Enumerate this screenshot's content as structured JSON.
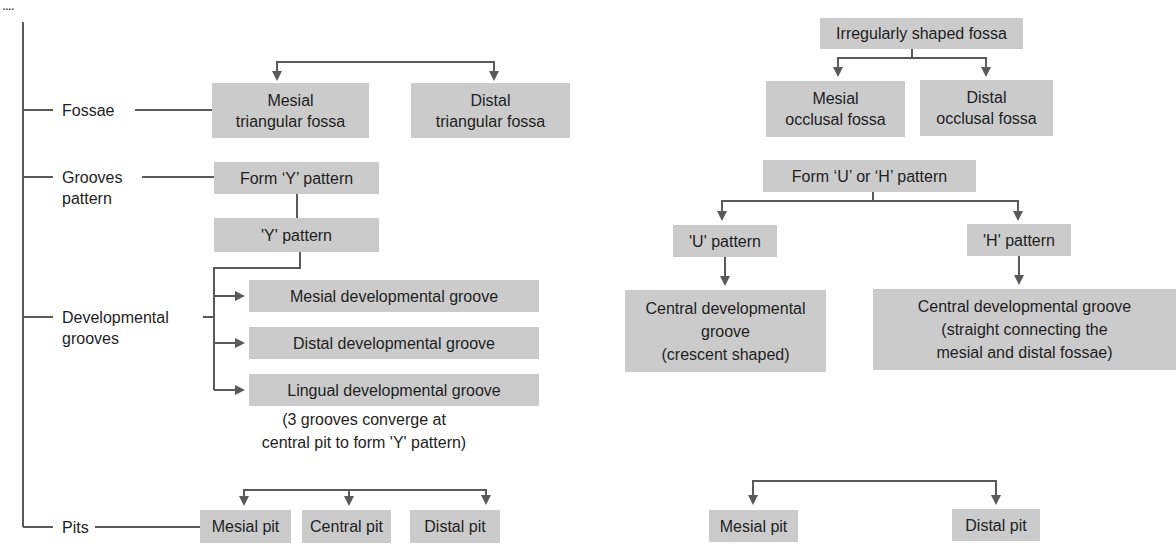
{
  "corner_mark": "....",
  "left": {
    "categories": [
      {
        "label": "Fossae"
      },
      {
        "label": "Grooves\npattern"
      },
      {
        "label": "Developmental\ngrooves"
      },
      {
        "label": "Pits"
      }
    ],
    "fossae": [
      "Mesial\ntriangular fossa",
      "Distal\ntriangular fossa"
    ],
    "grooves_pattern": {
      "form": "Form ‘Y’ pattern",
      "pattern": "'Y' pattern"
    },
    "developmental_grooves": [
      "Mesial developmental groove",
      "Distal developmental groove",
      "Lingual developmental groove"
    ],
    "note": "(3 grooves converge at\ncentral pit to form 'Y' pattern)",
    "pits": [
      "Mesial pit",
      "Central pit",
      "Distal pit"
    ]
  },
  "right": {
    "fossa_parent": "Irregularly shaped fossa",
    "fossae": [
      "Mesial\nocclusal fossa",
      "Distal\nocclusal fossa"
    ],
    "grooves_pattern": {
      "form": "Form ‘U’ or ‘H’ pattern",
      "u": "'U' pattern",
      "h": "'H' pattern"
    },
    "developmental_grooves": [
      "Central developmental\ngroove\n(crescent shaped)",
      "Central developmental groove\n(straight connecting the\nmesial and distal fossae)"
    ],
    "pits": [
      "Mesial pit",
      "Distal pit"
    ]
  },
  "colors": {
    "box_fill": "#cbcbcb",
    "line": "#5a5a5a",
    "text": "#1e1e1e"
  }
}
